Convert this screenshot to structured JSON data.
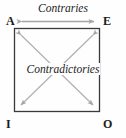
{
  "diagram": {
    "corners": [
      {
        "key": "A",
        "label": "A",
        "position": "top-left"
      },
      {
        "key": "E",
        "label": "E",
        "position": "top-right"
      },
      {
        "key": "I",
        "label": "I",
        "position": "bottom-left"
      },
      {
        "key": "O",
        "label": "O",
        "position": "bottom-right"
      }
    ],
    "relations": [
      {
        "key": "contraries",
        "label": "Contraries",
        "between": "A-E",
        "arrow": "double-headed-horizontal"
      },
      {
        "key": "contradictories",
        "label": "Contradictories",
        "between": "A-O and E-I",
        "arrow": "double-headed-diagonal-cross"
      }
    ],
    "colors": {
      "background": "#fefefe",
      "square_border": "#3a3a3a",
      "arrow": "#a8a8a8",
      "text": "#1b1b1b",
      "relation_text": "#242424"
    },
    "square": {
      "x": 14,
      "y": 28,
      "width": 86,
      "height": 84
    }
  }
}
